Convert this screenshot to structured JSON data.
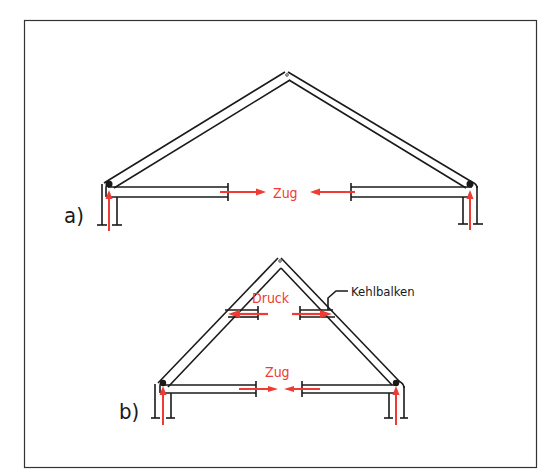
{
  "colors": {
    "line": "#1a1a1a",
    "force": "#ee3b33",
    "frame": "#333333"
  },
  "diagram_a": {
    "label": "a)",
    "tension_label": "Zug"
  },
  "diagram_b": {
    "label": "b)",
    "compression_label": "Druck",
    "tension_label": "Zug",
    "collar_beam_label": "Kehlbalken"
  }
}
